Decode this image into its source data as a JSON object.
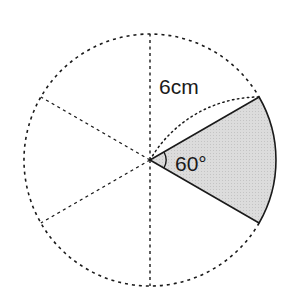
{
  "diagram": {
    "type": "circle-sector",
    "circle": {
      "cx": 150,
      "cy": 160,
      "r": 126,
      "style": "dotted"
    },
    "spokes_deg": [
      90,
      150,
      210,
      270
    ],
    "sector": {
      "start_deg": -30,
      "end_deg": 30,
      "fill": "#d6d6d6",
      "stroke": "#1a1a1a"
    },
    "guide_arc": {
      "style": "dotted",
      "description": "arc centered at lower sector vertex through circle center to upper vertex"
    },
    "angle_marker_r": 16
  },
  "labels": {
    "radius": "6cm",
    "angle": "60°"
  },
  "colors": {
    "line": "#1a1a1a",
    "shade": "#d6d6d6",
    "background": "#ffffff"
  }
}
